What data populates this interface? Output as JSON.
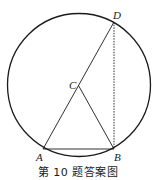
{
  "figure": {
    "caption": "第 10 题答案图",
    "circle": {
      "cx": 79,
      "cy": 85,
      "r": 72
    },
    "points": {
      "A": {
        "label": "A",
        "x": 43,
        "y": 149
      },
      "B": {
        "label": "B",
        "x": 114,
        "y": 149
      },
      "C": {
        "label": "C",
        "x": 78.5,
        "y": 85.5
      },
      "D": {
        "label": "D",
        "x": 114,
        "y": 22
      }
    },
    "segments": [
      {
        "from": "A",
        "to": "D",
        "style": "solid"
      },
      {
        "from": "C",
        "to": "B",
        "style": "solid"
      },
      {
        "from": "A",
        "to": "B",
        "style": "solid"
      },
      {
        "from": "D",
        "to": "B",
        "style": "dashed"
      }
    ],
    "colors": {
      "stroke": "#1a1a1a",
      "background": "#ffffff"
    }
  }
}
